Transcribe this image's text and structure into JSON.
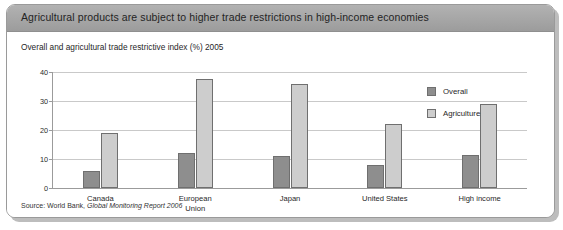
{
  "card": {
    "title": "Agricultural products are subject to higher trade restrictions in high-income economies",
    "subtitle": "Overall and agricultural trade restrictive index (%) 2005",
    "source_prefix": "Source: World Bank, ",
    "source_reference": "Global Monitoring Report 2006"
  },
  "colors": {
    "header_band": "#a6a6a6",
    "overall": "#8e8e8e",
    "agriculture": "#cdcdcd",
    "bar_outline": "#6f6f6f",
    "gridline": "#c9c9c9",
    "axis": "#9b9b9b"
  },
  "legend": {
    "position": "top-right",
    "items": [
      {
        "label": "Overall",
        "color": "#8e8e8e",
        "swatch": "overall"
      },
      {
        "label": "Agriculture",
        "color": "#cdcdcd",
        "swatch": "agriculture"
      }
    ]
  },
  "chart_data": {
    "type": "bar",
    "title": "Overall and agricultural trade restrictive index (%) 2005",
    "xlabel": "",
    "ylabel": "",
    "ylim": [
      0,
      40
    ],
    "yticks": [
      0,
      10,
      20,
      30,
      40
    ],
    "ytick_labels": [
      "0",
      "10",
      "20",
      "30",
      "40"
    ],
    "grid": true,
    "categories": [
      "Canada",
      "European\nUnion",
      "Japan",
      "United States",
      "High income"
    ],
    "series": [
      {
        "name": "Overall",
        "color": "#8e8e8e",
        "values": [
          6,
          12,
          11,
          8,
          11.5
        ]
      },
      {
        "name": "Agriculture",
        "color": "#cdcdcd",
        "values": [
          19,
          37.5,
          36,
          22,
          29
        ]
      }
    ]
  }
}
